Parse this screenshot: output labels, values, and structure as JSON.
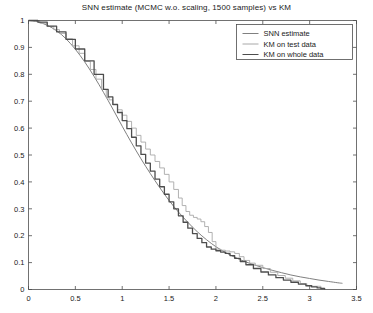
{
  "chart_data": {
    "type": "line",
    "title": "SNN estimate (MCMC w.o. scaling, 1500 samples) vs KM",
    "xlabel": "",
    "ylabel": "",
    "xlim": [
      0,
      3.5
    ],
    "ylim": [
      0,
      1
    ],
    "grid": false,
    "legend_position": "top-right",
    "xticks": [
      0,
      0.5,
      1,
      1.5,
      2,
      2.5,
      3,
      3.5
    ],
    "xtick_labels": [
      "0",
      "0.5",
      "1",
      "1.5",
      "2",
      "2.5",
      "3",
      "3.5"
    ],
    "yticks": [
      0,
      0.1,
      0.2,
      0.3,
      0.4,
      0.5,
      0.6,
      0.7,
      0.8,
      0.9,
      1
    ],
    "ytick_labels": [
      "0",
      "0.1",
      "0.2",
      "0.3",
      "0.4",
      "0.5",
      "0.6",
      "0.7",
      "0.8",
      "0.9",
      "1"
    ],
    "series": [
      {
        "name": "SNN estimate",
        "color": "#808080",
        "width": 1.0,
        "style": "smooth",
        "x": [
          0,
          0.1,
          0.2,
          0.3,
          0.4,
          0.5,
          0.6,
          0.7,
          0.8,
          0.9,
          1.0,
          1.1,
          1.2,
          1.3,
          1.4,
          1.5,
          1.6,
          1.7,
          1.8,
          1.9,
          2.0,
          2.1,
          2.2,
          2.3,
          2.4,
          2.5,
          2.6,
          2.7,
          2.8,
          2.9,
          3.0,
          3.1,
          3.2,
          3.3,
          3.35
        ],
        "y": [
          1.0,
          0.995,
          0.982,
          0.962,
          0.932,
          0.893,
          0.846,
          0.792,
          0.733,
          0.671,
          0.607,
          0.545,
          0.486,
          0.431,
          0.379,
          0.331,
          0.288,
          0.25,
          0.215,
          0.185,
          0.159,
          0.138,
          0.12,
          0.105,
          0.0925,
          0.0815,
          0.0715,
          0.0625,
          0.054,
          0.047,
          0.041,
          0.035,
          0.03,
          0.025,
          0.023
        ]
      },
      {
        "name": "KM on test data",
        "color": "#a8a8a8",
        "width": 0.9,
        "style": "step",
        "x": [
          0,
          0.12,
          0.2,
          0.27,
          0.33,
          0.4,
          0.47,
          0.54,
          0.6,
          0.66,
          0.72,
          0.78,
          0.83,
          0.86,
          0.9,
          0.95,
          1.0,
          1.05,
          1.1,
          1.15,
          1.2,
          1.25,
          1.3,
          1.35,
          1.4,
          1.45,
          1.5,
          1.55,
          1.6,
          1.64,
          1.68,
          1.72,
          1.76,
          1.8,
          1.84,
          1.88,
          1.92,
          1.96,
          2.0,
          2.05,
          2.1,
          2.15,
          2.2,
          2.25,
          2.3,
          2.36,
          2.42,
          2.5,
          2.58,
          2.66,
          2.74,
          2.82,
          2.9,
          2.97,
          3.03,
          3.08,
          3.12,
          3.16
        ],
        "y": [
          1.0,
          0.99,
          0.978,
          0.966,
          0.952,
          0.932,
          0.906,
          0.878,
          0.848,
          0.818,
          0.782,
          0.744,
          0.714,
          0.705,
          0.686,
          0.668,
          0.648,
          0.625,
          0.6,
          0.573,
          0.548,
          0.522,
          0.5,
          0.476,
          0.452,
          0.428,
          0.4,
          0.372,
          0.34,
          0.312,
          0.29,
          0.276,
          0.268,
          0.262,
          0.252,
          0.234,
          0.212,
          0.178,
          0.15,
          0.146,
          0.143,
          0.14,
          0.134,
          0.122,
          0.108,
          0.098,
          0.09,
          0.078,
          0.064,
          0.052,
          0.042,
          0.032,
          0.022,
          0.014,
          0.012,
          0.012,
          0.006,
          0.0
        ]
      },
      {
        "name": "KM on whole data",
        "color": "#4d4d4d",
        "width": 1.3,
        "style": "step",
        "x": [
          0,
          0.1,
          0.2,
          0.3,
          0.4,
          0.5,
          0.6,
          0.7,
          0.8,
          0.85,
          0.9,
          0.95,
          1.0,
          1.05,
          1.1,
          1.15,
          1.2,
          1.25,
          1.3,
          1.35,
          1.4,
          1.45,
          1.5,
          1.55,
          1.6,
          1.65,
          1.7,
          1.75,
          1.8,
          1.85,
          1.9,
          1.95,
          2.0,
          2.05,
          2.1,
          2.15,
          2.2,
          2.26,
          2.32,
          2.4,
          2.48,
          2.56,
          2.64,
          2.72,
          2.8,
          2.88,
          2.96,
          3.02,
          3.08,
          3.12,
          3.16
        ],
        "y": [
          1.0,
          0.994,
          0.979,
          0.958,
          0.93,
          0.894,
          0.85,
          0.8,
          0.744,
          0.716,
          0.688,
          0.658,
          0.628,
          0.598,
          0.566,
          0.534,
          0.502,
          0.47,
          0.44,
          0.41,
          0.382,
          0.354,
          0.326,
          0.3,
          0.274,
          0.25,
          0.228,
          0.208,
          0.19,
          0.174,
          0.158,
          0.15,
          0.144,
          0.139,
          0.134,
          0.126,
          0.116,
          0.104,
          0.092,
          0.078,
          0.065,
          0.054,
          0.044,
          0.035,
          0.027,
          0.02,
          0.014,
          0.01,
          0.006,
          0.003,
          0.0
        ]
      }
    ]
  },
  "legend": {
    "items": [
      {
        "label": "SNN estimate",
        "color": "#808080"
      },
      {
        "label": "KM on test data",
        "color": "#a8a8a8"
      },
      {
        "label": "KM on whole data",
        "color": "#4d4d4d"
      }
    ]
  }
}
